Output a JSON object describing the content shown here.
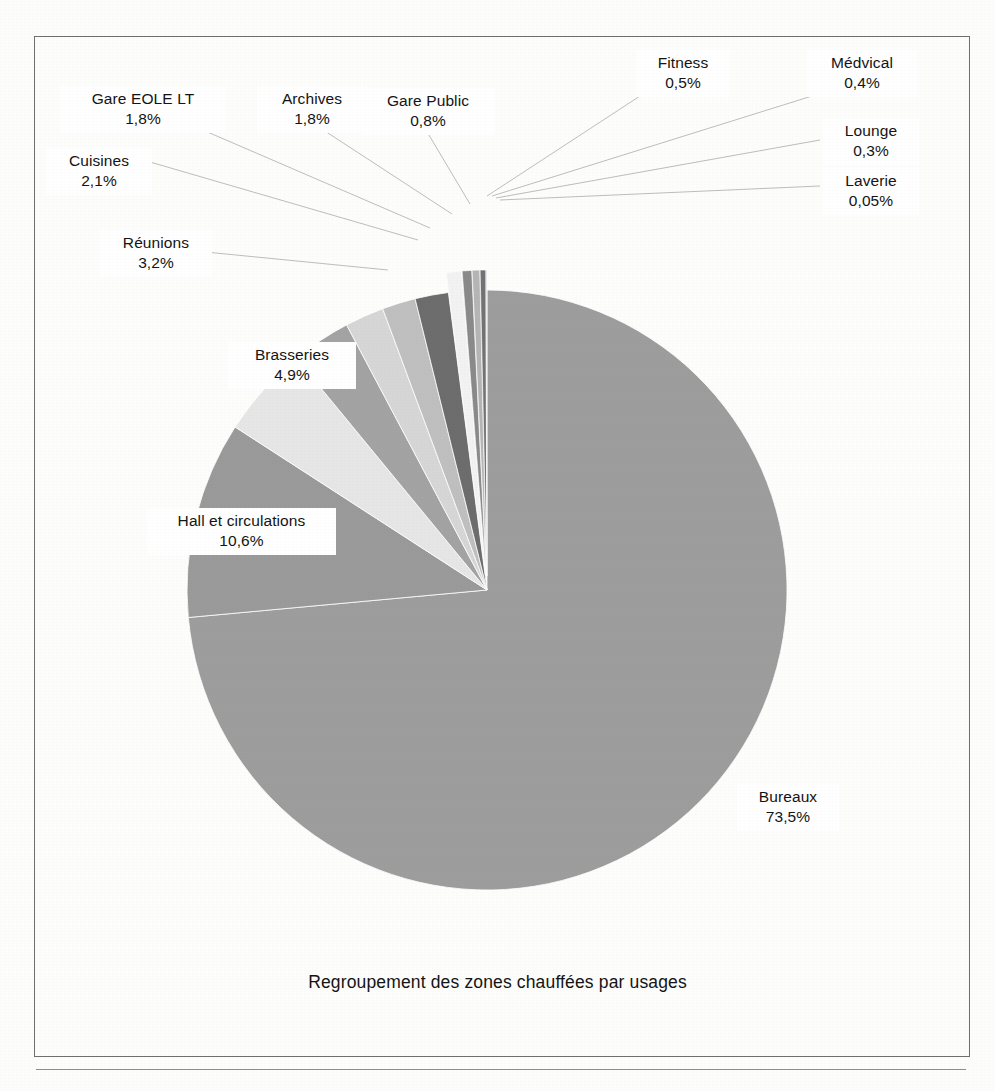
{
  "figure": {
    "caption": "Regroupement des zones chauffées par usages"
  },
  "chart_data": {
    "type": "pie",
    "title": "Regroupement des zones chauffées par usages",
    "value_suffix": "%",
    "decimal_separator": ",",
    "legend": "none",
    "labels_position": "outside-with-leader-lines",
    "start_angle_deg": 0,
    "direction": "clockwise",
    "categories": [
      "Bureaux",
      "Hall et circulations",
      "Brasseries",
      "Réunions",
      "Cuisines",
      "Gare EOLE LT",
      "Archives",
      "Gare Public",
      "Fitness",
      "Médvical",
      "Lounge",
      "Laverie"
    ],
    "values": [
      73.5,
      10.6,
      4.9,
      3.2,
      2.1,
      1.8,
      1.8,
      0.8,
      0.5,
      0.4,
      0.3,
      0.05
    ],
    "value_labels": [
      "73,5%",
      "10,6%",
      "4,9%",
      "3,2%",
      "2,1%",
      "1,8%",
      "1,8%",
      "0,8%",
      "0,5%",
      "0,4%",
      "0,3%",
      "0,05%"
    ],
    "colors": [
      "#9d9d9d",
      "#9a9a9a",
      "#e6e6e6",
      "#a3a3a3",
      "#d6d6d6",
      "#bfbfbf",
      "#6d6d6d",
      "#f2f2f2",
      "#8a8a8a",
      "#b5b5b5",
      "#737373",
      "#cfcfcf"
    ],
    "slices": [
      {
        "name": "Bureaux",
        "value": 73.5,
        "value_label": "73,5%",
        "color": "#9d9d9d"
      },
      {
        "name": "Hall et circulations",
        "value": 10.6,
        "value_label": "10,6%",
        "color": "#9a9a9a"
      },
      {
        "name": "Brasseries",
        "value": 4.9,
        "value_label": "4,9%",
        "color": "#e6e6e6"
      },
      {
        "name": "Réunions",
        "value": 3.2,
        "value_label": "3,2%",
        "color": "#a3a3a3"
      },
      {
        "name": "Cuisines",
        "value": 2.1,
        "value_label": "2,1%",
        "color": "#d6d6d6"
      },
      {
        "name": "Gare EOLE LT",
        "value": 1.8,
        "value_label": "1,8%",
        "color": "#bfbfbf"
      },
      {
        "name": "Archives",
        "value": 1.8,
        "value_label": "1,8%",
        "color": "#6d6d6d"
      },
      {
        "name": "Gare Public",
        "value": 0.8,
        "value_label": "0,8%",
        "color": "#f2f2f2"
      },
      {
        "name": "Fitness",
        "value": 0.5,
        "value_label": "0,5%",
        "color": "#8a8a8a"
      },
      {
        "name": "Médvical",
        "value": 0.4,
        "value_label": "0,4%",
        "color": "#b5b5b5"
      },
      {
        "name": "Lounge",
        "value": 0.3,
        "value_label": "0,3%",
        "color": "#737373"
      },
      {
        "name": "Laverie",
        "value": 0.05,
        "value_label": "0,05%",
        "color": "#cfcfcf"
      }
    ]
  },
  "labels": {
    "gare_eole_lt": {
      "name": "Gare EOLE LT",
      "pct": "1,8%"
    },
    "archives": {
      "name": "Archives",
      "pct": "1,8%"
    },
    "gare_public": {
      "name": "Gare Public",
      "pct": "0,8%"
    },
    "fitness": {
      "name": "Fitness",
      "pct": "0,5%"
    },
    "medvical": {
      "name": "Médvical",
      "pct": "0,4%"
    },
    "lounge": {
      "name": "Lounge",
      "pct": "0,3%"
    },
    "laverie": {
      "name": "Laverie",
      "pct": "0,05%"
    },
    "cuisines": {
      "name": "Cuisines",
      "pct": "2,1%"
    },
    "reunions": {
      "name": "Réunions",
      "pct": "3,2%"
    },
    "brasseries": {
      "name": "Brasseries",
      "pct": "4,9%"
    },
    "hall": {
      "name": "Hall et circulations",
      "pct": "10,6%"
    },
    "bureaux": {
      "name": "Bureaux",
      "pct": "73,5%"
    }
  }
}
